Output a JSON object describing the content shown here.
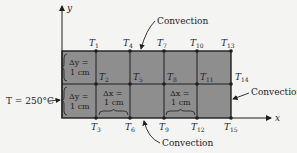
{
  "diagram": {
    "axes": {
      "x_label": "x",
      "y_label": "y"
    },
    "boundary_left": "T = 250°C",
    "convection_labels": {
      "top": "Convection",
      "right": "Convection",
      "bottom": "Convection"
    },
    "spacing": {
      "dy_top": {
        "line1": "Δy =",
        "line2": "1 cm"
      },
      "dy_bottom": {
        "line1": "Δy =",
        "line2": "1 cm"
      },
      "dx_left": {
        "line1": "Δx =",
        "line2": "1 cm"
      },
      "dx_right": {
        "line1": "Δx =",
        "line2": "1 cm"
      }
    },
    "nodes": {
      "T1": {
        "base": "T",
        "sub": "1"
      },
      "T2": {
        "base": "T",
        "sub": "2"
      },
      "T3": {
        "base": "T",
        "sub": "3"
      },
      "T4": {
        "base": "T",
        "sub": "4"
      },
      "T5": {
        "base": "T",
        "sub": "5"
      },
      "T6": {
        "base": "T",
        "sub": "6"
      },
      "T7": {
        "base": "T",
        "sub": "7"
      },
      "T8": {
        "base": "T",
        "sub": "8"
      },
      "T9": {
        "base": "T",
        "sub": "9"
      },
      "T10": {
        "base": "T",
        "sub": "10"
      },
      "T11": {
        "base": "T",
        "sub": "11"
      },
      "T12": {
        "base": "T",
        "sub": "12"
      },
      "T13": {
        "base": "T",
        "sub": "13"
      },
      "T14": {
        "base": "T",
        "sub": "14"
      },
      "T15": {
        "base": "T",
        "sub": "15"
      }
    },
    "colors": {
      "plate_fill": "#8e8e8e",
      "line": "#1e1e1e",
      "background": "#f4f4f2"
    }
  }
}
